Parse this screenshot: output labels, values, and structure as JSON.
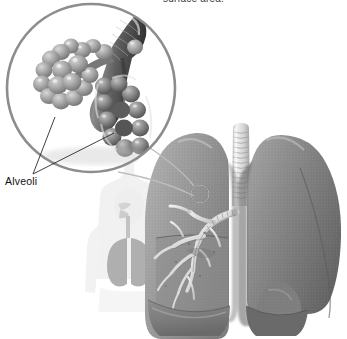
{
  "figure": {
    "domain": "diagram",
    "kind": "anatomical-illustration",
    "style": "grayscale airbrush medical illustration on white background",
    "width": 347,
    "height": 339
  },
  "caption": {
    "top_text": "surface area.",
    "top_text_note": "partially cropped at the top edge of the image"
  },
  "labels": [
    {
      "id": "alveoli",
      "text": "Alveoli"
    }
  ],
  "magnifier": {
    "name": "magnified-inset-circle",
    "center_x": 91,
    "center_y": 88,
    "radius": 85,
    "stroke": "#8d8d8d",
    "stroke_width": 2.6,
    "contents": "bronchiole branching into two grape-like clusters of alveolar sacs"
  },
  "callout": {
    "target_marker": {
      "cx": 200,
      "cy": 194,
      "r": 9,
      "stroke": "#7a7a7a"
    },
    "leader_lines": 2,
    "stroke": "#b9b9b9"
  },
  "label_leaders": [
    {
      "from": "Alveoli",
      "to": "left alveolar cluster"
    },
    {
      "from": "Alveoli",
      "to": "right alveolar cluster"
    }
  ],
  "silhouette": {
    "name": "human-torso-silhouette",
    "description": "faint pale outline of a head, neck and upper torso showing nasal cavity, pharynx, trachea and lungs",
    "fill": "#efefef",
    "organ_fill": "#d6d6d6"
  },
  "lungs": {
    "name": "lung-diagram",
    "trachea": {
      "label": "trachea",
      "rings": 14,
      "fill": "#e9e9e9",
      "ring_stroke": "#a8a8a8"
    },
    "left_lung_view": {
      "label": "cutaway lung showing bronchial tree",
      "position": "viewer-left",
      "fill": "#9a9a9a",
      "cut_face_fill": "#8f8f8f",
      "bronchial_tree_fill": "#dcdcdc"
    },
    "right_lung_view": {
      "label": "intact lung",
      "position": "viewer-right",
      "fill": "#8a8a8a",
      "shadow_fill": "#6e6e6e"
    },
    "note": "both lungs are cropped by the bottom edge of the image"
  },
  "colors": {
    "background": "#ffffff",
    "text": "#1c1c1c",
    "line": "#2a2a2a",
    "circle_outline": "#8d8d8d",
    "mid_gray": "#9a9a9a",
    "dark_gray": "#5a5a5a",
    "light_gray": "#d8d8d8"
  }
}
